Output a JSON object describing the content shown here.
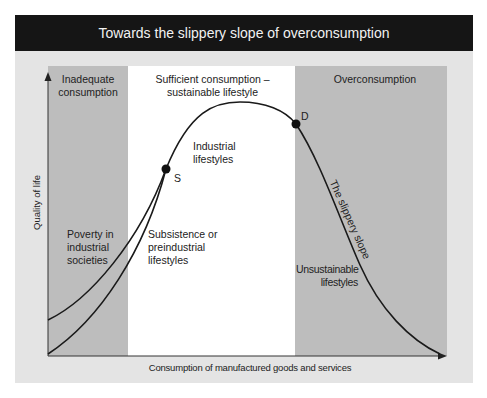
{
  "title": "Towards the slippery slope of overconsumption",
  "colors": {
    "header_bg": "#151515",
    "header_text": "#f2f2f2",
    "frame_bg": "#e4e4e4",
    "shaded_zone": "#bdbdbd",
    "sufficient_zone": "#ffffff",
    "curve": "#1a1a1a"
  },
  "axes": {
    "y_label": "Quality of life",
    "x_label": "Consumption of manufactured goods and services"
  },
  "zones": [
    {
      "id": "inadequate",
      "label_line1": "Inadequate",
      "label_line2": "consumption"
    },
    {
      "id": "sufficient",
      "label_line1": "Sufficient consumption –",
      "label_line2": "sustainable lifestyle"
    },
    {
      "id": "over",
      "label_line1": "Overconsumption"
    }
  ],
  "points": {
    "s": "S",
    "d": "D"
  },
  "annotations": {
    "industrial": [
      "Industrial",
      "lifestyles"
    ],
    "poverty": [
      "Poverty in",
      "industrial",
      "societies"
    ],
    "subsistence": [
      "Subsistence or",
      "preindustrial",
      "lifestyles"
    ],
    "slope": "The slippery slope",
    "unsustainable": [
      "Unsustainable",
      "lifestyles"
    ]
  }
}
